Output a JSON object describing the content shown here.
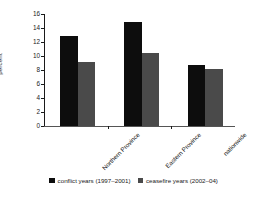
{
  "chart_data": {
    "type": "bar",
    "title": "",
    "subtitle": "",
    "xlabel": "",
    "ylabel": "percent",
    "ylim": [
      0,
      16
    ],
    "yticks": [
      0,
      2,
      4,
      6,
      8,
      10,
      12,
      14,
      16
    ],
    "ytick_labels": [
      "0",
      "2",
      "4",
      "6",
      "8",
      "10",
      "12",
      "14",
      "16"
    ],
    "grid": false,
    "legend_position": "bottom",
    "categories": [
      "Northern Province",
      "Eastern Province",
      "nationwide"
    ],
    "series": [
      {
        "name": "conflict years (1997–2001)",
        "color": "#0d0d0d",
        "values": [
          12.9,
          14.9,
          8.7
        ]
      },
      {
        "name": "ceasefire years (2002–04)",
        "color": "#4a4a4a",
        "values": [
          9.1,
          10.4,
          8.2
        ]
      }
    ]
  },
  "legend": {
    "items": [
      {
        "label": "conflict years (1997–2001)",
        "color": "#0d0d0d"
      },
      {
        "label": "ceasefire years (2002–04)",
        "color": "#4a4a4a"
      }
    ]
  },
  "colors": {
    "series_conflict": "#0d0d0d",
    "series_ceasefire": "#4a4a4a",
    "axis": "#1a1a1a",
    "background": "#ffffff"
  }
}
